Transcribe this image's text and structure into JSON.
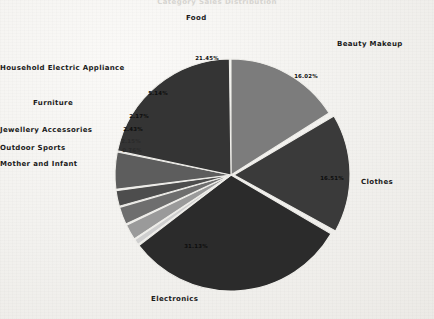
{
  "chart_data": {
    "type": "pie",
    "title": "Category Sales Distribution",
    "xlabel": "",
    "ylabel": "",
    "legend_position": "none",
    "grid": false,
    "categories": [
      "Beauty Makeup",
      "Clothes",
      "Electronics",
      "Mother and Infant",
      "Outdoor Sports",
      "Jewellery Accessories",
      "Furniture",
      "Household Electric Appliance",
      "Food"
    ],
    "values": [
      16.02,
      16.51,
      31.13,
      0.76,
      2.15,
      2.43,
      2.17,
      5.14,
      21.45
    ],
    "labels": [
      "16.02%",
      "16.51%",
      "31.13%",
      "0.76%",
      "2.15%",
      "2.43%",
      "2.17%",
      "5.14%",
      "21.45%"
    ],
    "colors": [
      "#7c7c7c",
      "#3a3a3a",
      "#2b2b2b",
      "#cfcfcf",
      "#9a9a9a",
      "#6e6e6e",
      "#4d4d4d",
      "#5d5d5d",
      "#343434"
    ],
    "slices": [
      {
        "name": "Beauty Makeup",
        "pct": 16.02,
        "label": "16.02%",
        "color": "#7c7c7c",
        "start": 0.0,
        "end": 57.7,
        "explode": 0,
        "label_x": 306,
        "label_y": 78,
        "cat_x": 337,
        "cat_y": 40,
        "cat_align": "left"
      },
      {
        "name": "Clothes",
        "pct": 16.51,
        "label": "16.51%",
        "color": "#3a3a3a",
        "start": 59.5,
        "end": 118.9,
        "explode": 3,
        "label_x": 332,
        "label_y": 180,
        "cat_x": 361,
        "cat_y": 178,
        "cat_align": "left"
      },
      {
        "name": "Electronics",
        "pct": 31.13,
        "label": "31.13%",
        "color": "#2b2b2b",
        "start": 120.5,
        "end": 232.5,
        "explode": 0,
        "label_x": 196,
        "label_y": 248,
        "cat_x": 151,
        "cat_y": 295,
        "cat_align": "left"
      },
      {
        "name": "Mother and Infant",
        "pct": 0.76,
        "label": "0.76%",
        "color": "#cfcfcf",
        "start": 233.3,
        "end": 236.0,
        "explode": 0,
        "label_x": 132,
        "label_y": 152,
        "cat_x": 24,
        "cat_y": 160,
        "cat_align": "right"
      },
      {
        "name": "Outdoor Sports",
        "pct": 2.15,
        "label": "2.15%",
        "color": "#9a9a9a",
        "start": 236.6,
        "end": 244.3,
        "explode": 0,
        "label_x": 131,
        "label_y": 143,
        "cat_x": 39,
        "cat_y": 144,
        "cat_align": "right"
      },
      {
        "name": "Jewellery Accessories",
        "pct": 2.43,
        "label": "2.43%",
        "color": "#6e6e6e",
        "start": 245.0,
        "end": 253.8,
        "explode": 0,
        "label_x": 133,
        "label_y": 131,
        "cat_x": 14,
        "cat_y": 126,
        "cat_align": "right"
      },
      {
        "name": "Furniture",
        "pct": 2.17,
        "label": "2.17%",
        "color": "#4d4d4d",
        "start": 254.4,
        "end": 262.2,
        "explode": 0,
        "label_x": 139,
        "label_y": 118,
        "cat_x": 73,
        "cat_y": 99,
        "cat_align": "right"
      },
      {
        "name": "Household Electric Appliance",
        "pct": 5.14,
        "label": "5.14%",
        "color": "#5d5d5d",
        "start": 262.9,
        "end": 281.4,
        "explode": 0,
        "label_x": 158,
        "label_y": 95,
        "cat_x": 17,
        "cat_y": 64,
        "cat_align": "right"
      },
      {
        "name": "Food",
        "pct": 21.45,
        "label": "21.45%",
        "color": "#343434",
        "start": 282.0,
        "end": 359.2,
        "explode": 0,
        "label_x": 207,
        "label_y": 60,
        "cat_x": 186,
        "cat_y": 14,
        "cat_align": "left"
      }
    ],
    "geometry": {
      "cx": 231,
      "cy": 175,
      "r": 116
    }
  }
}
